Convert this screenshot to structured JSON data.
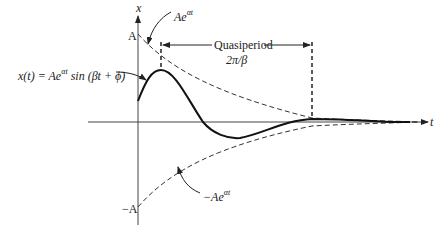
{
  "diagram": {
    "axes": {
      "vertical_label": "x",
      "horizontal_label": "t",
      "tick_top": "A",
      "tick_bottom": "−A"
    },
    "labels": {
      "equation_prefix": "x(t) = Ae",
      "equation_exp": "αt",
      "equation_suffix": " sin (βt + ϕ)",
      "upper_envelope_base": "Ae",
      "upper_envelope_exp": "αt",
      "lower_envelope_base": "−Ae",
      "lower_envelope_exp": "αt",
      "quasiperiod_title": "Quasiperiod",
      "quasiperiod_value": "2π/β"
    },
    "colors": {
      "stroke": "#222222",
      "axis": "#444444",
      "background": "#ffffff"
    }
  }
}
